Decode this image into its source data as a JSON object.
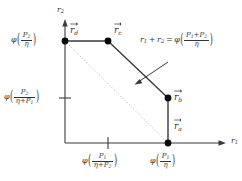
{
  "figure": {
    "type": "geometric-region-diagram",
    "background_color": "#ffffff",
    "line_color": "#3a3a3a",
    "dot_color": "#000000",
    "dotted_color": "#b0b0b0"
  },
  "axes": {
    "x_label": "r",
    "x_label_sub": "1",
    "y_label": "r",
    "y_label_sub": "2",
    "origin_px": [
      65,
      143
    ],
    "x_axis_end_px": [
      228,
      143
    ],
    "y_axis_end_px": [
      65,
      22
    ]
  },
  "points": [
    {
      "id": "r_a",
      "label_base": "r",
      "label_sub": "a",
      "px": [
        168,
        143
      ],
      "label_px": [
        174,
        122
      ],
      "description": "vertex on the r1 axis"
    },
    {
      "id": "r_b",
      "label_base": "r",
      "label_sub": "b",
      "px": [
        168,
        98
      ],
      "label_px": [
        174,
        93
      ],
      "description": "vertex where vertical segment meets sloped boundary"
    },
    {
      "id": "r_c",
      "label_base": "r",
      "label_sub": "c",
      "px": [
        108,
        41
      ],
      "label_px": [
        114,
        26
      ],
      "description": "vertex where horizontal segment meets sloped boundary"
    },
    {
      "id": "r_d",
      "label_base": "r",
      "label_sub": "d",
      "px": [
        65,
        41
      ],
      "label_px": [
        70,
        26
      ],
      "description": "vertex on the r2 axis"
    }
  ],
  "ticks": {
    "y_tick_px": [
      65,
      98
    ],
    "x_tick_px": [
      108,
      143
    ]
  },
  "tick_labels": {
    "y_top": {
      "phi": "φ",
      "numerator": "P",
      "numerator_sub": "2",
      "denominator": "η",
      "anchor_px": [
        8,
        34
      ],
      "meaning": "phi(P2/eta) at r_d height"
    },
    "y_mid": {
      "phi": "φ",
      "numerator": "P",
      "numerator_sub": "2",
      "denominator_first": "η",
      "denominator_plus": "+",
      "denominator_second": "P",
      "denominator_second_sub": "1",
      "anchor_px": [
        3,
        90
      ],
      "meaning": "phi(P2/(eta+P1)) at r_b height"
    },
    "x_mid": {
      "phi": "φ",
      "numerator": "P",
      "numerator_sub": "1",
      "denominator_first": "η",
      "denominator_plus": "+",
      "denominator_second": "P",
      "denominator_second_sub": "2",
      "anchor_px": [
        82,
        152
      ],
      "meaning": "phi(P1/(eta+P2)) at r_c abscissa"
    },
    "x_right": {
      "phi": "φ",
      "numerator": "P",
      "numerator_sub": "1",
      "denominator": "η",
      "anchor_px": [
        148,
        152
      ],
      "meaning": "phi(P1/eta) at r_a abscissa"
    }
  },
  "annotation": {
    "lhs_r1": "r",
    "lhs_r1_sub": "1",
    "plus": "+",
    "lhs_r2": "r",
    "lhs_r2_sub": "2",
    "equals": "=",
    "phi": "φ",
    "numerator_first": "P",
    "numerator_first_sub": "1",
    "numerator_plus": "+",
    "numerator_second": "P",
    "numerator_second_sub": "2",
    "denominator": "η",
    "anchor_px": [
      140,
      33
    ],
    "arrow_from_px": [
      168,
      62
    ],
    "arrow_to_px": [
      136,
      84
    ],
    "meaning": "line r1 + r2 = phi((P1+P2)/eta)"
  },
  "boundary": {
    "segments": [
      {
        "from": "origin",
        "to_px": [
          65,
          143
        ],
        "kind": "axis"
      },
      {
        "from_px": [
          65,
          41
        ],
        "to_px": [
          108,
          41
        ],
        "kind": "solid-horizontal-top"
      },
      {
        "from_px": [
          108,
          41
        ],
        "to_px": [
          168,
          98
        ],
        "kind": "solid-sloped"
      },
      {
        "from_px": [
          168,
          98
        ],
        "to_px": [
          168,
          143
        ],
        "kind": "solid-vertical-right"
      }
    ],
    "dotted_chord": {
      "from_px": [
        65,
        41
      ],
      "to_px": [
        168,
        143
      ],
      "kind": "dotted-diagonal"
    }
  }
}
